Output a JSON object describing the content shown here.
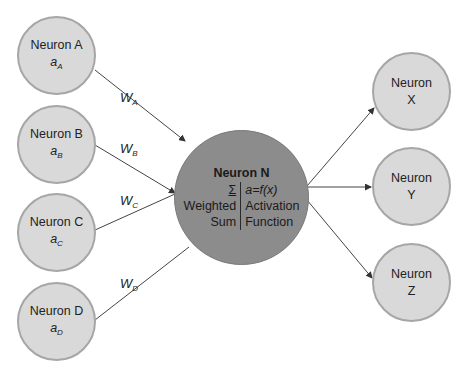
{
  "diagram": {
    "type": "neural-network-neuron",
    "colors": {
      "input_fill": "#d9d9d9",
      "input_border": "#a6a6a6",
      "central_fill": "#8c8c8c",
      "line": "#333333"
    },
    "inputs": [
      {
        "name": "Neuron A",
        "activation_base": "a",
        "activation_sub": "A",
        "weight_base": "W",
        "weight_sub": "A"
      },
      {
        "name": "Neuron B",
        "activation_base": "a",
        "activation_sub": "B",
        "weight_base": "W",
        "weight_sub": "B"
      },
      {
        "name": "Neuron C",
        "activation_base": "a",
        "activation_sub": "C",
        "weight_base": "W",
        "weight_sub": "C"
      },
      {
        "name": "Neuron D",
        "activation_base": "a",
        "activation_sub": "D",
        "weight_base": "W",
        "weight_sub": "D"
      }
    ],
    "central": {
      "title": "Neuron N",
      "left_symbol": "Σ",
      "left_line1": "Weighted",
      "left_line2": "Sum",
      "right_formula": "a=f(x)",
      "right_line1": "Activation",
      "right_line2": "Function"
    },
    "outputs": [
      {
        "line1": "Neuron",
        "line2": "X"
      },
      {
        "line1": "Neuron",
        "line2": "Y"
      },
      {
        "line1": "Neuron",
        "line2": "Z"
      }
    ]
  }
}
